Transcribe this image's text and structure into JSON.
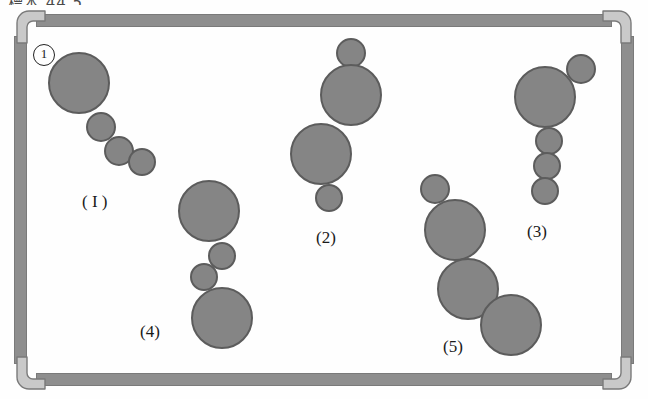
{
  "figure": {
    "top_caption": "標本 44 5",
    "marker_label": "1",
    "frame": {
      "border_color": "#8e8e8e",
      "corner_color": "#c9c9c9",
      "corner_outline": "#7a7a7a"
    },
    "circle_style": {
      "fill": "#858585",
      "stroke": "#5c5c5c"
    },
    "clusters": [
      {
        "id": "cluster-1",
        "label": "( I )",
        "label_x": 82,
        "label_y": 192,
        "circles": [
          {
            "x": 48,
            "y": 52,
            "d": 62
          },
          {
            "x": 86,
            "y": 112,
            "d": 30
          },
          {
            "x": 104,
            "y": 136,
            "d": 30
          },
          {
            "x": 128,
            "y": 148,
            "d": 28
          }
        ]
      },
      {
        "id": "cluster-2",
        "label": "(2)",
        "label_x": 316,
        "label_y": 228,
        "circles": [
          {
            "x": 336,
            "y": 38,
            "d": 30
          },
          {
            "x": 320,
            "y": 64,
            "d": 62
          },
          {
            "x": 290,
            "y": 123,
            "d": 62
          },
          {
            "x": 315,
            "y": 184,
            "d": 28
          }
        ]
      },
      {
        "id": "cluster-3",
        "label": "(3)",
        "label_x": 527,
        "label_y": 222,
        "circles": [
          {
            "x": 566,
            "y": 54,
            "d": 30
          },
          {
            "x": 514,
            "y": 66,
            "d": 62
          },
          {
            "x": 535,
            "y": 127,
            "d": 28
          },
          {
            "x": 533,
            "y": 152,
            "d": 28
          },
          {
            "x": 531,
            "y": 177,
            "d": 28
          }
        ]
      },
      {
        "id": "cluster-4",
        "label": "(4)",
        "label_x": 140,
        "label_y": 322,
        "circles": [
          {
            "x": 178,
            "y": 180,
            "d": 62
          },
          {
            "x": 208,
            "y": 242,
            "d": 28
          },
          {
            "x": 190,
            "y": 263,
            "d": 28
          },
          {
            "x": 191,
            "y": 287,
            "d": 62
          }
        ]
      },
      {
        "id": "cluster-5",
        "label": "(5)",
        "label_x": 443,
        "label_y": 337,
        "circles": [
          {
            "x": 420,
            "y": 174,
            "d": 30
          },
          {
            "x": 424,
            "y": 199,
            "d": 62
          },
          {
            "x": 437,
            "y": 258,
            "d": 62
          },
          {
            "x": 480,
            "y": 294,
            "d": 62
          }
        ]
      }
    ]
  }
}
